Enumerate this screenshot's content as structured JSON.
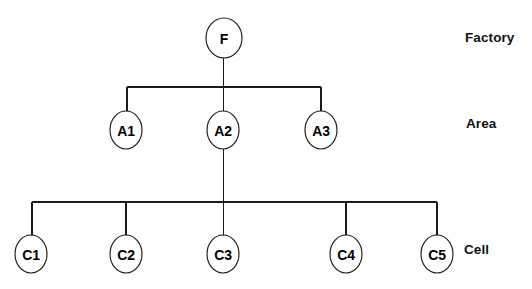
{
  "diagram": {
    "type": "tree",
    "background_color": "#ffffff",
    "line_color": "#1a1a1a",
    "text_color": "#000000",
    "nodes": [
      {
        "id": "F",
        "label": "F",
        "tier": "Factory",
        "cx": 224,
        "cy": 38,
        "rx": 18,
        "ry": 20
      },
      {
        "id": "A1",
        "label": "A1",
        "tier": "Area",
        "cx": 126,
        "cy": 130,
        "rx": 16,
        "ry": 19
      },
      {
        "id": "A2",
        "label": "A2",
        "tier": "Area",
        "cx": 223,
        "cy": 130,
        "rx": 16,
        "ry": 19
      },
      {
        "id": "A3",
        "label": "A3",
        "tier": "Area",
        "cx": 321,
        "cy": 130,
        "rx": 16,
        "ry": 19
      },
      {
        "id": "C1",
        "label": "C1",
        "tier": "Cell",
        "cx": 31,
        "cy": 254,
        "rx": 16,
        "ry": 19
      },
      {
        "id": "C2",
        "label": "C2",
        "tier": "Cell",
        "cx": 126,
        "cy": 254,
        "rx": 16,
        "ry": 19
      },
      {
        "id": "C3",
        "label": "C3",
        "tier": "Cell",
        "cx": 223,
        "cy": 254,
        "rx": 16,
        "ry": 19
      },
      {
        "id": "C4",
        "label": "C4",
        "tier": "Cell",
        "cx": 346,
        "cy": 254,
        "rx": 16,
        "ry": 19
      },
      {
        "id": "C5",
        "label": "C5",
        "tier": "Cell",
        "cx": 437,
        "cy": 254,
        "rx": 16,
        "ry": 19
      }
    ],
    "edges": [
      {
        "from": "F",
        "to": "A1"
      },
      {
        "from": "F",
        "to": "A2"
      },
      {
        "from": "F",
        "to": "A3"
      },
      {
        "from": "A2",
        "to": "C1"
      },
      {
        "from": "A2",
        "to": "C2"
      },
      {
        "from": "A2",
        "to": "C3"
      },
      {
        "from": "A2",
        "to": "C4"
      },
      {
        "from": "A2",
        "to": "C5"
      }
    ],
    "connectors": {
      "factory_stem": {
        "x": 223.5,
        "y1": 58,
        "y2": 87
      },
      "area_bus": {
        "y": 87,
        "x1": 127,
        "x2": 321
      },
      "area_drops": [
        {
          "x": 127,
          "y1": 87,
          "y2": 111
        },
        {
          "x": 223.5,
          "y1": 87,
          "y2": 111
        },
        {
          "x": 321,
          "y1": 87,
          "y2": 111
        }
      ],
      "area2_stem": {
        "x": 223.5,
        "y1": 149,
        "y2": 202
      },
      "cell_bus": {
        "y": 202,
        "x1": 32,
        "x2": 437
      },
      "cell_drops": [
        {
          "x": 32,
          "y1": 202,
          "y2": 236
        },
        {
          "x": 126,
          "y1": 202,
          "y2": 236
        },
        {
          "x": 223.5,
          "y1": 202,
          "y2": 236
        },
        {
          "x": 346,
          "y1": 202,
          "y2": 236
        },
        {
          "x": 437,
          "y1": 202,
          "y2": 236
        }
      ]
    },
    "tier_labels": [
      {
        "id": "factory",
        "text": "Factory",
        "x": 465,
        "y": 38
      },
      {
        "id": "area",
        "text": "Area",
        "x": 466,
        "y": 124
      },
      {
        "id": "cell",
        "text": "Cell",
        "x": 464,
        "y": 250
      }
    ]
  }
}
